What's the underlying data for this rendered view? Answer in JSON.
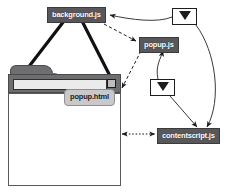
{
  "diagram": {
    "colors": {
      "node_dark_bg": "#58585a",
      "node_dark_text": "#ffffff",
      "node_light_bg": "#c9c9cb",
      "node_light_text": "#202022",
      "browser_chrome": "#6e6e70",
      "stroke": "#1d1d1f",
      "page_bg": "#ffffff"
    },
    "nodes": [
      {
        "id": "background",
        "label": "background.js",
        "style": "dark"
      },
      {
        "id": "popupjs",
        "label": "popup.js",
        "style": "dark"
      },
      {
        "id": "contentscript",
        "label": "contentscript.js",
        "style": "dark"
      },
      {
        "id": "popuphtml",
        "label": "popup.html",
        "style": "light"
      }
    ],
    "icons": [
      {
        "id": "envelope-top",
        "name": "envelope-icon"
      },
      {
        "id": "envelope-mid",
        "name": "envelope-icon"
      }
    ],
    "browser": {
      "name": "browser-window",
      "parts": [
        "browser-tab",
        "browser-toolbar",
        "omnibox",
        "browser-action-button",
        "browser-content"
      ]
    },
    "edges": [
      {
        "from": "background",
        "to": "browser-tab",
        "style": "solid-thick"
      },
      {
        "from": "background",
        "to": "action-button",
        "style": "solid-thick"
      },
      {
        "from": "background",
        "to": "popupjs",
        "style": "dashed"
      },
      {
        "from": "popupjs",
        "to": "popuphtml",
        "style": "dashed"
      },
      {
        "from": "envelope-top",
        "to": "background",
        "style": "solid-thin"
      },
      {
        "from": "envelope-top",
        "to": "contentscript",
        "style": "solid-thin-curve"
      },
      {
        "from": "envelope-mid",
        "to": "popupjs",
        "style": "solid-thin-curve"
      },
      {
        "from": "envelope-mid",
        "to": "contentscript",
        "style": "solid-thin"
      },
      {
        "from": "browser-content",
        "to": "contentscript",
        "style": "dotted-bidirectional"
      }
    ]
  }
}
